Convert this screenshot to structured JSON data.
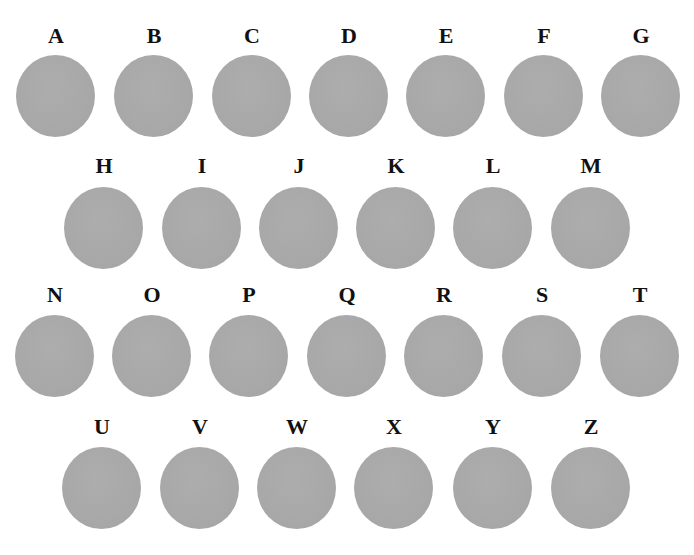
{
  "figure": {
    "rows": [
      {
        "label_top": 24,
        "disc_top": 55,
        "items": [
          {
            "letter": "A",
            "x": 16
          },
          {
            "letter": "B",
            "x": 114
          },
          {
            "letter": "C",
            "x": 212
          },
          {
            "letter": "D",
            "x": 309
          },
          {
            "letter": "E",
            "x": 406
          },
          {
            "letter": "F",
            "x": 504
          },
          {
            "letter": "G",
            "x": 601
          }
        ]
      },
      {
        "label_top": 154,
        "disc_top": 187,
        "items": [
          {
            "letter": "H",
            "x": 64
          },
          {
            "letter": "I",
            "x": 162
          },
          {
            "letter": "J",
            "x": 259
          },
          {
            "letter": "K",
            "x": 356
          },
          {
            "letter": "L",
            "x": 453
          },
          {
            "letter": "M",
            "x": 551
          }
        ]
      },
      {
        "label_top": 283,
        "disc_top": 315,
        "items": [
          {
            "letter": "N",
            "x": 15
          },
          {
            "letter": "O",
            "x": 112
          },
          {
            "letter": "P",
            "x": 209
          },
          {
            "letter": "Q",
            "x": 307
          },
          {
            "letter": "R",
            "x": 404
          },
          {
            "letter": "S",
            "x": 502
          },
          {
            "letter": "T",
            "x": 600
          }
        ]
      },
      {
        "label_top": 415,
        "disc_top": 447,
        "items": [
          {
            "letter": "U",
            "x": 62
          },
          {
            "letter": "V",
            "x": 160
          },
          {
            "letter": "W",
            "x": 257
          },
          {
            "letter": "X",
            "x": 354
          },
          {
            "letter": "Y",
            "x": 453
          },
          {
            "letter": "Z",
            "x": 551
          }
        ]
      }
    ],
    "disc_color": "#a9a9a9",
    "letter_color": "#111111"
  }
}
